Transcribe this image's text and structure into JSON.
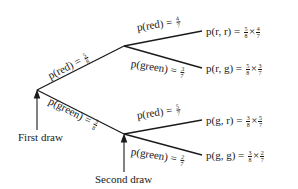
{
  "diagram": {
    "type": "probability-tree",
    "stages": {
      "first_draw_label": "First draw",
      "second_draw_label": "Second draw"
    },
    "first_branches": [
      {
        "event": "red",
        "label_prefix": "p(red) =",
        "num": "5",
        "den": "8"
      },
      {
        "event": "green",
        "label_prefix": "p(green) =",
        "num": "3",
        "den": "8"
      }
    ],
    "second_branches": [
      {
        "parent": "red",
        "event": "red",
        "label_prefix": "p(red) =",
        "num": "4",
        "den": "7",
        "outcome": "p(r, r) =",
        "f1n": "5",
        "f1d": "8",
        "f2n": "4",
        "f2d": "7"
      },
      {
        "parent": "red",
        "event": "green",
        "label_prefix": "p(green) =",
        "num": "3",
        "den": "7",
        "outcome": "p(r, g) =",
        "f1n": "5",
        "f1d": "8",
        "f2n": "3",
        "f2d": "7"
      },
      {
        "parent": "green",
        "event": "red",
        "label_prefix": "p(red) =",
        "num": "5",
        "den": "7",
        "outcome": "p(g, r) =",
        "f1n": "3",
        "f1d": "8",
        "f2n": "5",
        "f2d": "7"
      },
      {
        "parent": "green",
        "event": "green",
        "label_prefix": "p(green) =",
        "num": "2",
        "den": "7",
        "outcome": "p(g, g) =",
        "f1n": "3",
        "f1d": "8",
        "f2n": "2",
        "f2d": "7"
      }
    ],
    "times_symbol": "×"
  }
}
